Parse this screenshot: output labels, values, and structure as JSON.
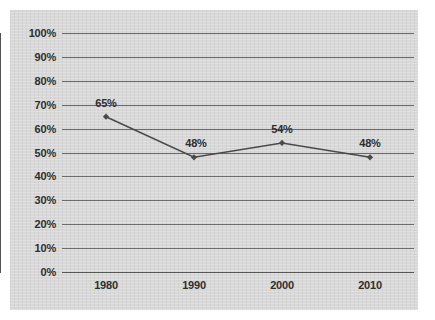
{
  "chart_data": {
    "type": "line",
    "title": "",
    "xlabel": "",
    "ylabel": "",
    "categories": [
      "1980",
      "1990",
      "2000",
      "2010"
    ],
    "values": [
      65,
      48,
      54,
      48
    ],
    "point_labels": [
      "65%",
      "48%",
      "54%",
      "48%"
    ],
    "label_offsets": [
      {
        "dx": 0,
        "dy": -8
      },
      {
        "dx": 2,
        "dy": -8
      },
      {
        "dx": 0,
        "dy": -8
      },
      {
        "dx": 0,
        "dy": -8
      }
    ],
    "ylim": [
      0,
      100
    ],
    "ytick_step": 10,
    "ytick_labels": [
      "0%",
      "10%",
      "20%",
      "30%",
      "40%",
      "50%",
      "60%",
      "70%",
      "80%",
      "90%",
      "100%"
    ],
    "ytick_values": [
      0,
      10,
      20,
      30,
      40,
      50,
      60,
      70,
      80,
      90,
      100
    ],
    "grid": true,
    "legend": false,
    "legend_position": "none",
    "series_color": "#4a4a4a",
    "grid_color": "#6b6b6b",
    "axis_color": "#555555",
    "panel_color": "#d8d8d8",
    "text_color": "#2e2e2e",
    "marker": "diamond"
  }
}
